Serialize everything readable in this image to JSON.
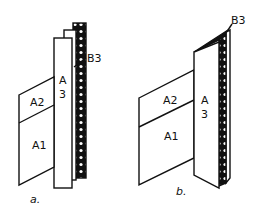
{
  "diagram": {
    "colors": {
      "ink": "#111111",
      "paper": "#ffffff"
    },
    "panels": {
      "a": {
        "caption": "a.",
        "labels": {
          "A1": "A1",
          "A2": "A2",
          "A3_top": "A",
          "A3_bottom": "3",
          "B3": "B3"
        }
      },
      "b": {
        "caption": "b.",
        "labels": {
          "A1": "A1",
          "A2": "A2",
          "A3_top": "A",
          "A3_bottom": "3",
          "B3": "B3"
        }
      }
    }
  }
}
